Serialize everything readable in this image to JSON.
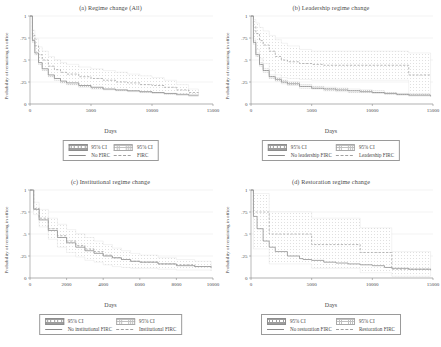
{
  "figure": {
    "background": "#ffffff",
    "axis_color": "#8a8a8a",
    "grid_color": "#e6e6e6",
    "solid_line_color": "#8a8a8a",
    "dashed_line_color": "#a0a0a0",
    "ci_fill_a": "#9e9e9e",
    "ci_fill_b": "#c0c0c0",
    "shared_ylabel": "Probability of remaining in office",
    "shared_xlabel": "Days",
    "shared_yticks": [
      "0",
      ".25",
      ".5",
      ".75",
      "1"
    ],
    "ci_label": "95% CI"
  },
  "chart_data": [
    {
      "type": "line",
      "panel": "a",
      "title": "(a) Regime change (All)",
      "xlabel": "Days",
      "ylabel": "Probability of remaining in office",
      "xlim": [
        0,
        15000
      ],
      "ylim": [
        0,
        1
      ],
      "xticks": [
        0,
        5000,
        10000,
        15000
      ],
      "xticklabels": [
        "0",
        "5000",
        "10000",
        "15000"
      ],
      "yticks": [
        0,
        0.25,
        0.5,
        0.75,
        1
      ],
      "yticklabels": [
        "0",
        ".25",
        ".5",
        ".75",
        "1"
      ],
      "grid": "horizontal",
      "legend": {
        "position": "below-axes",
        "entries": [
          {
            "label": "95% CI",
            "style": "patch",
            "series": "No FIRC"
          },
          {
            "label": "95% CI",
            "style": "patch",
            "series": "FIRC"
          },
          {
            "label": "No FIRC",
            "style": "solid"
          },
          {
            "label": "FIRC",
            "style": "dashed"
          }
        ]
      },
      "x": [
        0,
        200,
        400,
        700,
        1000,
        1500,
        2000,
        2500,
        3000,
        4000,
        5000,
        6000,
        7000,
        8000,
        9000,
        10000,
        11000,
        12000,
        13000,
        13800
      ],
      "series": [
        {
          "name": "No FIRC",
          "style": "solid",
          "values": [
            1.0,
            0.72,
            0.58,
            0.47,
            0.4,
            0.33,
            0.29,
            0.26,
            0.24,
            0.21,
            0.19,
            0.17,
            0.16,
            0.15,
            0.14,
            0.13,
            0.12,
            0.11,
            0.1,
            0.1
          ],
          "ci_lower": [
            1.0,
            0.7,
            0.56,
            0.45,
            0.38,
            0.31,
            0.27,
            0.24,
            0.22,
            0.19,
            0.17,
            0.16,
            0.15,
            0.14,
            0.13,
            0.12,
            0.11,
            0.1,
            0.09,
            0.09
          ],
          "ci_upper": [
            1.0,
            0.74,
            0.6,
            0.49,
            0.42,
            0.35,
            0.31,
            0.28,
            0.26,
            0.23,
            0.21,
            0.19,
            0.18,
            0.16,
            0.15,
            0.14,
            0.13,
            0.12,
            0.11,
            0.11
          ]
        },
        {
          "name": "FIRC",
          "style": "dashed",
          "values": [
            1.0,
            0.78,
            0.66,
            0.56,
            0.5,
            0.43,
            0.39,
            0.36,
            0.34,
            0.31,
            0.29,
            0.27,
            0.25,
            0.24,
            0.22,
            0.21,
            0.19,
            0.16,
            0.13,
            0.12
          ],
          "ci_lower": [
            1.0,
            0.72,
            0.58,
            0.47,
            0.4,
            0.33,
            0.29,
            0.26,
            0.24,
            0.21,
            0.19,
            0.17,
            0.16,
            0.15,
            0.14,
            0.13,
            0.12,
            0.1,
            0.09,
            0.09
          ],
          "ci_upper": [
            1.0,
            0.84,
            0.74,
            0.65,
            0.6,
            0.54,
            0.5,
            0.47,
            0.45,
            0.42,
            0.4,
            0.38,
            0.36,
            0.34,
            0.32,
            0.3,
            0.27,
            0.22,
            0.17,
            0.15
          ]
        }
      ]
    },
    {
      "type": "line",
      "panel": "b",
      "title": "(b) Leadership regime change",
      "xlabel": "Days",
      "ylabel": "Probability of remaining in office",
      "xlim": [
        0,
        15000
      ],
      "ylim": [
        0,
        1
      ],
      "xticks": [
        0,
        5000,
        10000,
        15000
      ],
      "xticklabels": [
        "0",
        "5000",
        "10000",
        "15000"
      ],
      "yticks": [
        0,
        0.25,
        0.5,
        0.75,
        1
      ],
      "yticklabels": [
        "0",
        ".25",
        ".5",
        ".75",
        "1"
      ],
      "grid": "horizontal",
      "legend": {
        "position": "below-axes",
        "entries": [
          {
            "label": "95% CI",
            "style": "patch",
            "series": "No leadership FIRC"
          },
          {
            "label": "95% CI",
            "style": "patch",
            "series": "Leadership FIRC"
          },
          {
            "label": "No leadership FIRC",
            "style": "solid"
          },
          {
            "label": "Leadership FIRC",
            "style": "dashed"
          }
        ]
      },
      "x": [
        0,
        200,
        400,
        700,
        1000,
        1500,
        2000,
        2500,
        3000,
        4000,
        5000,
        6000,
        7000,
        8000,
        9000,
        10000,
        11000,
        12000,
        13000,
        14000,
        14800
      ],
      "series": [
        {
          "name": "No leadership FIRC",
          "style": "solid",
          "values": [
            1.0,
            0.7,
            0.56,
            0.45,
            0.38,
            0.31,
            0.28,
            0.25,
            0.23,
            0.2,
            0.18,
            0.17,
            0.16,
            0.15,
            0.14,
            0.13,
            0.12,
            0.11,
            0.1,
            0.1,
            0.09
          ],
          "ci_lower": [
            1.0,
            0.68,
            0.54,
            0.43,
            0.36,
            0.29,
            0.26,
            0.23,
            0.21,
            0.18,
            0.17,
            0.15,
            0.14,
            0.13,
            0.13,
            0.12,
            0.11,
            0.1,
            0.09,
            0.09,
            0.08
          ],
          "ci_upper": [
            1.0,
            0.72,
            0.58,
            0.47,
            0.4,
            0.33,
            0.3,
            0.27,
            0.25,
            0.22,
            0.2,
            0.19,
            0.18,
            0.17,
            0.16,
            0.15,
            0.13,
            0.12,
            0.11,
            0.11,
            0.1
          ]
        },
        {
          "name": "Leadership FIRC",
          "style": "dashed",
          "values": [
            1.0,
            0.88,
            0.8,
            0.72,
            0.67,
            0.6,
            0.54,
            0.5,
            0.48,
            0.46,
            0.45,
            0.44,
            0.44,
            0.44,
            0.44,
            0.44,
            0.44,
            0.44,
            0.33,
            0.33,
            0.33
          ],
          "ci_lower": [
            1.0,
            0.74,
            0.62,
            0.52,
            0.46,
            0.38,
            0.33,
            0.3,
            0.29,
            0.28,
            0.27,
            0.27,
            0.27,
            0.27,
            0.27,
            0.27,
            0.27,
            0.27,
            0.12,
            0.12,
            0.12
          ],
          "ci_upper": [
            1.0,
            0.96,
            0.92,
            0.87,
            0.83,
            0.78,
            0.73,
            0.69,
            0.66,
            0.62,
            0.6,
            0.6,
            0.6,
            0.6,
            0.6,
            0.6,
            0.6,
            0.6,
            0.58,
            0.58,
            0.58
          ]
        }
      ]
    },
    {
      "type": "line",
      "panel": "c",
      "title": "(c) Institutional regime change",
      "xlabel": "Days",
      "ylabel": "Probability of remaining in office",
      "xlim": [
        0,
        10000
      ],
      "ylim": [
        0,
        1
      ],
      "xticks": [
        0,
        2000,
        4000,
        6000,
        8000,
        10000
      ],
      "xticklabels": [
        "0",
        "2000",
        "4000",
        "6000",
        "8000",
        "10000"
      ],
      "yticks": [
        0,
        0.25,
        0.5,
        0.75,
        1
      ],
      "yticklabels": [
        "0",
        ".25",
        ".5",
        ".75",
        "1"
      ],
      "grid": "horizontal",
      "legend": {
        "position": "below-axes",
        "entries": [
          {
            "label": "95% CI",
            "style": "patch",
            "series": "No institutional FIRC"
          },
          {
            "label": "95% CI",
            "style": "patch",
            "series": "Institutional FIRC"
          },
          {
            "label": "No institutional FIRC",
            "style": "solid"
          },
          {
            "label": "Institutional FIRC",
            "style": "dashed"
          }
        ]
      },
      "x": [
        0,
        200,
        500,
        1000,
        1500,
        2000,
        2500,
        3000,
        3500,
        4000,
        4500,
        5000,
        5500,
        6000,
        7000,
        8000,
        9000,
        9900
      ],
      "series": [
        {
          "name": "No institutional FIRC",
          "style": "solid",
          "values": [
            1.0,
            0.78,
            0.66,
            0.54,
            0.46,
            0.4,
            0.35,
            0.31,
            0.28,
            0.25,
            0.23,
            0.21,
            0.19,
            0.18,
            0.16,
            0.14,
            0.13,
            0.12
          ],
          "ci_lower": [
            1.0,
            0.76,
            0.64,
            0.52,
            0.44,
            0.38,
            0.33,
            0.29,
            0.26,
            0.24,
            0.22,
            0.2,
            0.18,
            0.17,
            0.15,
            0.13,
            0.12,
            0.11
          ],
          "ci_upper": [
            1.0,
            0.8,
            0.68,
            0.56,
            0.48,
            0.42,
            0.37,
            0.33,
            0.3,
            0.27,
            0.25,
            0.23,
            0.21,
            0.19,
            0.17,
            0.15,
            0.14,
            0.13
          ]
        },
        {
          "name": "Institutional FIRC",
          "style": "dashed",
          "values": [
            1.0,
            0.79,
            0.68,
            0.56,
            0.48,
            0.42,
            0.37,
            0.33,
            0.3,
            0.26,
            0.23,
            0.21,
            0.19,
            0.18,
            0.16,
            0.15,
            0.13,
            0.12
          ],
          "ci_lower": [
            1.0,
            0.72,
            0.58,
            0.44,
            0.35,
            0.29,
            0.24,
            0.2,
            0.18,
            0.15,
            0.13,
            0.12,
            0.11,
            0.11,
            0.1,
            0.09,
            0.09,
            0.08
          ],
          "ci_upper": [
            1.0,
            0.86,
            0.78,
            0.68,
            0.61,
            0.55,
            0.5,
            0.46,
            0.42,
            0.38,
            0.34,
            0.31,
            0.28,
            0.26,
            0.23,
            0.21,
            0.19,
            0.17
          ]
        }
      ]
    },
    {
      "type": "line",
      "panel": "d",
      "title": "(d) Restoration regime change",
      "xlabel": "Days",
      "ylabel": "Probability of remaining in office",
      "xlim": [
        0,
        15000
      ],
      "ylim": [
        0,
        1
      ],
      "xticks": [
        0,
        5000,
        10000,
        15000
      ],
      "xticklabels": [
        "0",
        "5000",
        "10000",
        "15000"
      ],
      "yticks": [
        0,
        0.25,
        0.5,
        0.75,
        1
      ],
      "yticklabels": [
        "0",
        ".25",
        ".5",
        ".75",
        "1"
      ],
      "grid": "horizontal",
      "legend": {
        "position": "below-axes",
        "entries": [
          {
            "label": "95% CI",
            "style": "patch",
            "series": "No restoration FIRC"
          },
          {
            "label": "95% CI",
            "style": "patch",
            "series": "Restoration FIRC"
          },
          {
            "label": "No restoration FIRC",
            "style": "solid"
          },
          {
            "label": "Restoration FIRC",
            "style": "dashed"
          }
        ]
      },
      "x": [
        0,
        200,
        500,
        1000,
        1500,
        2000,
        3000,
        4000,
        4300,
        5000,
        6000,
        7000,
        8000,
        9000,
        10000,
        11000,
        11600,
        12000,
        13000,
        14000,
        14800
      ],
      "series": [
        {
          "name": "No restoration FIRC",
          "style": "solid",
          "values": [
            1.0,
            0.7,
            0.56,
            0.42,
            0.35,
            0.3,
            0.25,
            0.22,
            0.21,
            0.2,
            0.18,
            0.17,
            0.16,
            0.15,
            0.14,
            0.12,
            0.11,
            0.11,
            0.1,
            0.1,
            0.09
          ],
          "ci_lower": [
            1.0,
            0.68,
            0.54,
            0.4,
            0.33,
            0.28,
            0.23,
            0.2,
            0.2,
            0.18,
            0.17,
            0.16,
            0.15,
            0.14,
            0.13,
            0.11,
            0.1,
            0.1,
            0.09,
            0.09,
            0.08
          ],
          "ci_upper": [
            1.0,
            0.72,
            0.58,
            0.44,
            0.37,
            0.32,
            0.27,
            0.24,
            0.23,
            0.22,
            0.2,
            0.19,
            0.18,
            0.16,
            0.15,
            0.13,
            0.12,
            0.12,
            0.11,
            0.11,
            0.1
          ]
        },
        {
          "name": "Restoration FIRC",
          "style": "dashed",
          "values": [
            1.0,
            0.75,
            0.75,
            0.75,
            0.5,
            0.5,
            0.5,
            0.5,
            0.5,
            0.38,
            0.38,
            0.38,
            0.38,
            0.29,
            0.29,
            0.29,
            0.1,
            0.1,
            0.1,
            0.1,
            0.1
          ],
          "ci_lower": [
            1.0,
            0.33,
            0.33,
            0.33,
            0.16,
            0.16,
            0.16,
            0.16,
            0.16,
            0.11,
            0.11,
            0.11,
            0.11,
            0.06,
            0.06,
            0.06,
            0.02,
            0.02,
            0.02,
            0.02,
            0.02
          ],
          "ci_upper": [
            1.0,
            0.96,
            0.96,
            0.96,
            0.75,
            0.75,
            0.75,
            0.75,
            0.75,
            0.68,
            0.68,
            0.68,
            0.68,
            0.57,
            0.57,
            0.57,
            0.3,
            0.3,
            0.3,
            0.3,
            0.3
          ]
        }
      ]
    }
  ]
}
